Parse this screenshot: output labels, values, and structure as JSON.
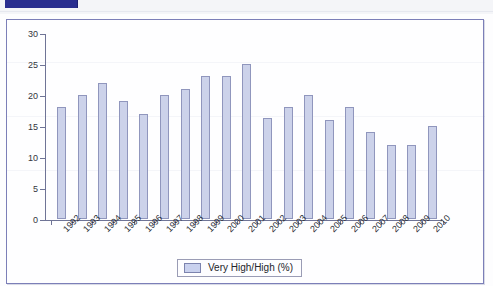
{
  "window": {
    "selection_bar_label": "",
    "selection_accent": "#2a2f90"
  },
  "legend": {
    "label": "Very High/High (%)",
    "swatch_color": "#c9d1ee",
    "position": "bottom-center"
  },
  "colors": {
    "bar_fill": "#c9d1ee",
    "bar_border": "#9096bd",
    "frame_border": "#7c7fb8",
    "axis": "#6f7496"
  },
  "chart_data": {
    "type": "bar",
    "title": "",
    "subtitle": "",
    "xlabel": "",
    "ylabel": "",
    "grid": false,
    "ylim": [
      0,
      30
    ],
    "yticks": [
      30,
      25,
      20,
      15,
      10,
      5,
      0
    ],
    "categories": [
      "1992",
      "1993",
      "1994",
      "1995",
      "1996",
      "1997",
      "1998",
      "1999",
      "2000",
      "2001",
      "2002",
      "2003",
      "2004",
      "2005",
      "2006",
      "2007",
      "2008",
      "2009",
      "2010"
    ],
    "series": [
      {
        "name": "Very High/High (%)",
        "values": [
          18,
          20,
          22,
          19,
          17,
          20,
          21,
          23,
          23,
          25,
          16.3,
          18,
          20,
          16,
          18,
          14,
          12,
          12,
          15
        ]
      }
    ],
    "legend_entries": [
      "Very High/High (%)"
    ]
  }
}
